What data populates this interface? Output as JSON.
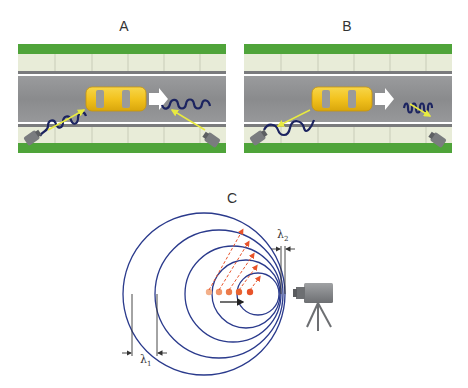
{
  "figure": {
    "panels": [
      {
        "id": "A",
        "label": "A",
        "description": "Car moving right; radar waves from both roadside sensors have equal wavelength"
      },
      {
        "id": "B",
        "label": "B",
        "description": "Car moving right; wave behind car stretched, wave ahead compressed"
      },
      {
        "id": "C",
        "label": "C",
        "description": "Doppler effect: moving source emits concentric wavefronts, compressed toward camera"
      }
    ],
    "panel_c": {
      "lambda1_label": "λ",
      "lambda1_sub": "1",
      "lambda2_label": "λ",
      "lambda2_sub": "2"
    },
    "colors": {
      "grass": "#4fa43a",
      "sidewalk": "#e8ecd8",
      "road": "#8f9092",
      "lane_line": "#ffffff",
      "car": "#f2c21e",
      "wave": "#1c2460",
      "wave_arrow": "#e8ea40",
      "wavefront": "#2a3a8c",
      "source": "#e8532a",
      "camera": "#808285"
    }
  }
}
